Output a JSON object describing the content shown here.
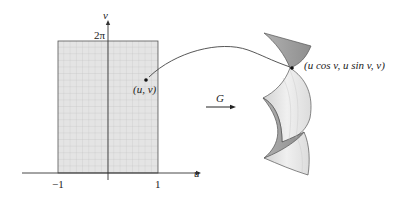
{
  "diagram": {
    "domain_plot": {
      "u_axis_label": "u",
      "v_axis_label": "v",
      "u_ticks": [
        "−1",
        "1"
      ],
      "v_tick": "2π",
      "point_label": "(u, v)",
      "u_range": [
        -1,
        1
      ],
      "v_range": [
        0,
        "2π"
      ]
    },
    "map_label": "G",
    "surface": {
      "point_label": "(u cos v, u sin v, v)",
      "description": "helicoid"
    },
    "colors": {
      "grid_fill": "#e2e2e2",
      "grid_line": "#b8b8b8",
      "surface_dark": "#9a9a9a",
      "surface_light": "#e6e6e6",
      "ink": "#222222"
    }
  }
}
